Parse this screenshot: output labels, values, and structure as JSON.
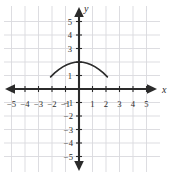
{
  "figure": {
    "name": "coordinate-plane-parabola",
    "background_color": "#ffffff",
    "axis_color": "#2b2b2b",
    "grid_color": "#d9d9de",
    "curve_color": "#2b2b2b"
  },
  "axis_labels": {
    "x": "x",
    "y": "y"
  },
  "x_ticks": [
    {
      "value": -5,
      "label": "−5"
    },
    {
      "value": -4,
      "label": "−4"
    },
    {
      "value": -3,
      "label": "−3"
    },
    {
      "value": -2,
      "label": "−2"
    },
    {
      "value": -1,
      "label": "−1"
    },
    {
      "value": 1,
      "label": "1"
    },
    {
      "value": 2,
      "label": "2"
    },
    {
      "value": 3,
      "label": "3"
    },
    {
      "value": 4,
      "label": "4"
    },
    {
      "value": 5,
      "label": "5"
    }
  ],
  "y_ticks": [
    {
      "value": 5,
      "label": "5"
    },
    {
      "value": 4,
      "label": "4"
    },
    {
      "value": 3,
      "label": "3"
    },
    {
      "value": 1,
      "label": "1"
    },
    {
      "value": -1,
      "label": "−1"
    },
    {
      "value": -2,
      "label": "−2"
    },
    {
      "value": -3,
      "label": "−3"
    },
    {
      "value": -4,
      "label": "−4"
    },
    {
      "value": -5,
      "label": "−5"
    }
  ],
  "chart_data": {
    "type": "line",
    "title": "",
    "subtitle": "",
    "xlabel": "x",
    "ylabel": "y",
    "xlim": [
      -5.6,
      5.6
    ],
    "ylim": [
      -5.6,
      5.6
    ],
    "grid": true,
    "legend": null,
    "legend_position": "none",
    "xticks": [
      -5,
      -4,
      -3,
      -2,
      -1,
      1,
      2,
      3,
      4,
      5
    ],
    "yticks": [
      5,
      4,
      3,
      1,
      -1,
      -2,
      -3,
      -4,
      -5
    ],
    "xtick_labels": [
      "−5",
      "−4",
      "−3",
      "−2",
      "−1",
      "1",
      "2",
      "3",
      "4",
      "5"
    ],
    "ytick_labels": [
      "5",
      "4",
      "3",
      "1",
      "−1",
      "−2",
      "−3",
      "−4",
      "−5"
    ],
    "annotations": [],
    "series": [
      {
        "name": "downward parabola",
        "equation": "y = 2 - 0.25x^2",
        "vertex": [
          0,
          2
        ],
        "opens": "down",
        "domain": [
          -2.1,
          2.1
        ],
        "x": [
          -2.1,
          -1.8,
          -1.5,
          -1.2,
          -0.9,
          -0.6,
          -0.3,
          0,
          0.3,
          0.6,
          0.9,
          1.2,
          1.5,
          1.8,
          2.1
        ],
        "values": [
          0.9,
          1.19,
          1.44,
          1.64,
          1.8,
          1.91,
          1.98,
          2,
          1.98,
          1.91,
          1.8,
          1.64,
          1.44,
          1.19,
          0.9
        ]
      }
    ]
  }
}
